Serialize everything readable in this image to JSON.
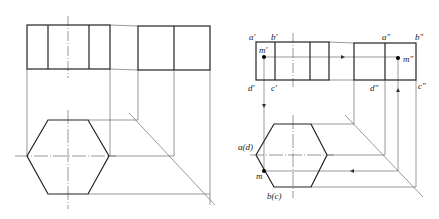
{
  "figure": {
    "left_drawing": {
      "title": "hexagonal prism three views (unlabeled)"
    },
    "right_drawing": {
      "labels": {
        "a_front": "a′",
        "b_front": "b′",
        "m_front": "m′",
        "d_front": "d′",
        "c_front": "c′",
        "a_side": "a″",
        "b_side": "b″",
        "m_side": "m″",
        "d_side": "d″",
        "c_side": "c″",
        "ad_top": "a(d)",
        "m_top": "m",
        "bc_top": "b(c)"
      }
    },
    "colors": {
      "line": "#222222",
      "thin": "#444444",
      "background": "#ffffff"
    }
  }
}
